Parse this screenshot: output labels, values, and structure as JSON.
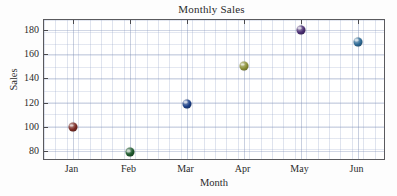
{
  "chart_data": {
    "type": "scatter",
    "title": "Monthly Sales",
    "xlabel": "Month",
    "ylabel": "Sales",
    "categories": [
      "Jan",
      "Feb",
      "Mar",
      "Apr",
      "May",
      "Jun"
    ],
    "values": [
      100,
      79,
      119,
      150,
      180,
      170
    ],
    "series": [
      {
        "name": "Sales",
        "values": [
          100,
          79,
          119,
          150,
          180,
          170
        ]
      }
    ],
    "points": [
      {
        "x": "Jan",
        "y": 100,
        "color": "#7a2a24"
      },
      {
        "x": "Feb",
        "y": 79,
        "color": "#1f5a2e"
      },
      {
        "x": "Mar",
        "y": 119,
        "color": "#1b3f87"
      },
      {
        "x": "Apr",
        "y": 150,
        "color": "#8a8f37"
      },
      {
        "x": "May",
        "y": 180,
        "color": "#4b2f74"
      },
      {
        "x": "Jun",
        "y": 170,
        "color": "#2e6a95"
      }
    ],
    "ylim": [
      72,
      188
    ],
    "yticks": [
      80,
      100,
      120,
      140,
      160,
      180
    ],
    "ytick_labels": [
      "80",
      "100",
      "120",
      "140",
      "160",
      "180"
    ],
    "xtick_labels": [
      "Jan",
      "Feb",
      "Mar",
      "Apr",
      "May",
      "Jun"
    ],
    "grid": true,
    "grid_minor": true,
    "legend": "none",
    "marker": "sphere",
    "background_color": "#ffffff",
    "axis_color": "#5a5a5e",
    "grid_color": "#7a8ab2"
  }
}
